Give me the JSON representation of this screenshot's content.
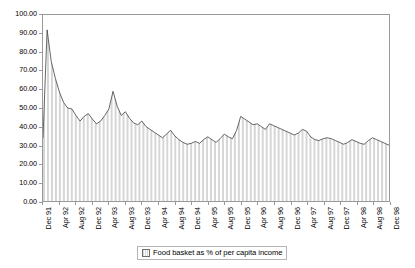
{
  "chart_data": {
    "type": "area",
    "title": "",
    "xlabel": "",
    "ylabel": "",
    "ylim": [
      0,
      100
    ],
    "ytick_step": 10,
    "grid": false,
    "legend_position": "bottom",
    "series_name": "Food basket as % of per capita income",
    "fill_color": "#d9d9d9",
    "line_color": "#404040",
    "ytick_labels": [
      "100.00",
      "90.00",
      "80.00",
      "70.00",
      "60.00",
      "50.00",
      "40.00",
      "30.00",
      "20.00",
      "10.00",
      "0.00"
    ],
    "ytick_values": [
      100,
      90,
      80,
      70,
      60,
      50,
      40,
      30,
      20,
      10,
      0
    ],
    "xtick_labels": [
      "Dec 91",
      "Apr 92",
      "Aug 92",
      "Dec 92",
      "Apr 93",
      "Aug 93",
      "Dec 93",
      "Apr 94",
      "Aug 94",
      "Dec 94",
      "Apr 95",
      "Aug 95",
      "Dec 95",
      "Apr 96",
      "Aug 96",
      "Dec 96",
      "Apr 97",
      "Aug 97",
      "Dec 97",
      "Apr 98",
      "Aug 98",
      "Dec 98"
    ],
    "xtick_indices": [
      0,
      4,
      8,
      12,
      16,
      20,
      24,
      28,
      32,
      36,
      40,
      44,
      48,
      52,
      56,
      60,
      64,
      68,
      72,
      76,
      80,
      84
    ],
    "x": [
      "Dec 91",
      "Jan 92",
      "Feb 92",
      "Mar 92",
      "Apr 92",
      "May 92",
      "Jun 92",
      "Jul 92",
      "Aug 92",
      "Sep 92",
      "Oct 92",
      "Nov 92",
      "Dec 92",
      "Jan 93",
      "Feb 93",
      "Mar 93",
      "Apr 93",
      "May 93",
      "Jun 93",
      "Jul 93",
      "Aug 93",
      "Sep 93",
      "Oct 93",
      "Nov 93",
      "Dec 93",
      "Jan 94",
      "Feb 94",
      "Mar 94",
      "Apr 94",
      "May 94",
      "Jun 94",
      "Jul 94",
      "Aug 94",
      "Sep 94",
      "Oct 94",
      "Nov 94",
      "Dec 94",
      "Jan 95",
      "Feb 95",
      "Mar 95",
      "Apr 95",
      "May 95",
      "Jun 95",
      "Jul 95",
      "Aug 95",
      "Sep 95",
      "Oct 95",
      "Nov 95",
      "Dec 95",
      "Jan 96",
      "Feb 96",
      "Mar 96",
      "Apr 96",
      "May 96",
      "Jun 96",
      "Jul 96",
      "Aug 96",
      "Sep 96",
      "Oct 96",
      "Nov 96",
      "Dec 96",
      "Jan 97",
      "Feb 97",
      "Mar 97",
      "Apr 97",
      "May 97",
      "Jun 97",
      "Jul 97",
      "Aug 97",
      "Sep 97",
      "Oct 97",
      "Nov 97",
      "Dec 97",
      "Jan 98",
      "Feb 98",
      "Mar 98",
      "Apr 98",
      "May 98",
      "Jun 98",
      "Jul 98",
      "Aug 98",
      "Sep 98",
      "Oct 98",
      "Nov 98",
      "Dec 98"
    ],
    "values": [
      34.0,
      92.0,
      75.0,
      66.0,
      58.5,
      53.0,
      50.0,
      49.5,
      46.0,
      43.0,
      45.5,
      47.0,
      44.0,
      41.5,
      43.0,
      46.0,
      49.5,
      59.0,
      51.0,
      46.0,
      48.0,
      44.5,
      42.0,
      41.0,
      43.0,
      40.0,
      38.5,
      37.0,
      35.5,
      34.0,
      36.0,
      38.0,
      35.0,
      33.0,
      31.5,
      30.5,
      31.0,
      32.0,
      31.0,
      33.0,
      34.5,
      33.0,
      31.5,
      33.5,
      36.0,
      34.5,
      33.5,
      38.0,
      45.5,
      44.0,
      42.5,
      41.0,
      41.5,
      40.0,
      38.5,
      41.5,
      40.5,
      39.5,
      38.5,
      37.5,
      36.5,
      35.5,
      36.5,
      38.5,
      37.5,
      34.5,
      33.0,
      32.5,
      33.5,
      34.0,
      33.5,
      32.5,
      31.5,
      30.5,
      31.5,
      33.0,
      32.0,
      31.0,
      30.5,
      32.5,
      34.0,
      33.0,
      32.0,
      31.0,
      30.0
    ]
  },
  "legend": {
    "label": "Food basket as % of per capita income",
    "swatch_name": "series-swatch"
  }
}
